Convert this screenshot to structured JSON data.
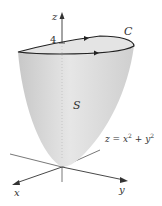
{
  "diagram": {
    "labels": {
      "z_axis": "z",
      "x_axis": "x",
      "y_axis": "y",
      "height_tick": "4",
      "curve": "C",
      "surface": "S",
      "equation_lhs": "z = x",
      "equation_exp1": "2",
      "equation_mid": " + y",
      "equation_exp2": "2"
    },
    "colors": {
      "surface_fill": "#d9d9d9",
      "surface_light": "#eeeeee",
      "curve": "#222222",
      "axes": "#444444",
      "background": "#ffffff"
    }
  }
}
